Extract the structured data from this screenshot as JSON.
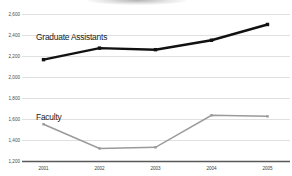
{
  "chart_data": {
    "type": "line",
    "title": "",
    "subtitle": "",
    "xlabel": "",
    "ylabel": "",
    "categories": [
      "2001",
      "2002",
      "2003",
      "2004",
      "2005"
    ],
    "ylim": [
      1200,
      2600
    ],
    "ytick_labels": [
      "2,600",
      "2,400",
      "2,200",
      "2,000",
      "1,800",
      "1,600",
      "1,400",
      "1,200"
    ],
    "ytick_values": [
      2600,
      2400,
      2200,
      2000,
      1800,
      1600,
      1400,
      1200
    ],
    "grid": true,
    "legend_position": "inline-labels",
    "series": [
      {
        "name": "Graduate Assistants",
        "color": "#111111",
        "values": [
          2170,
          2280,
          2265,
          2355,
          2505
        ]
      },
      {
        "name": "Faculty",
        "color": "#9a9a9a",
        "values": [
          1555,
          1325,
          1335,
          1640,
          1630
        ]
      }
    ],
    "annotations": [
      {
        "text": "Graduate Assistants",
        "x": "2001",
        "y": 2400
      },
      {
        "text": "Faculty",
        "x": "2001",
        "y": 1600
      }
    ]
  },
  "colors": {
    "grid": "#d8d8d8",
    "axis": "#595959",
    "graduate_assistants": "#111111",
    "faculty": "#9a9a9a",
    "tick_text": "#4a4a4a"
  }
}
